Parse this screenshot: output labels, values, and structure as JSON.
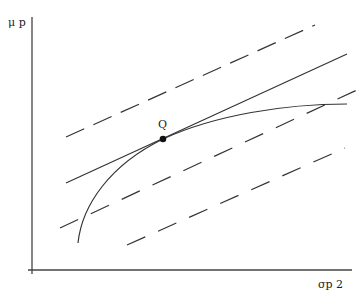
{
  "diagram": {
    "y_axis_label": "μ p",
    "x_axis_label": "σp 2",
    "point_label": "Q",
    "colors": {
      "line": "#333333",
      "background": "#ffffff"
    }
  }
}
